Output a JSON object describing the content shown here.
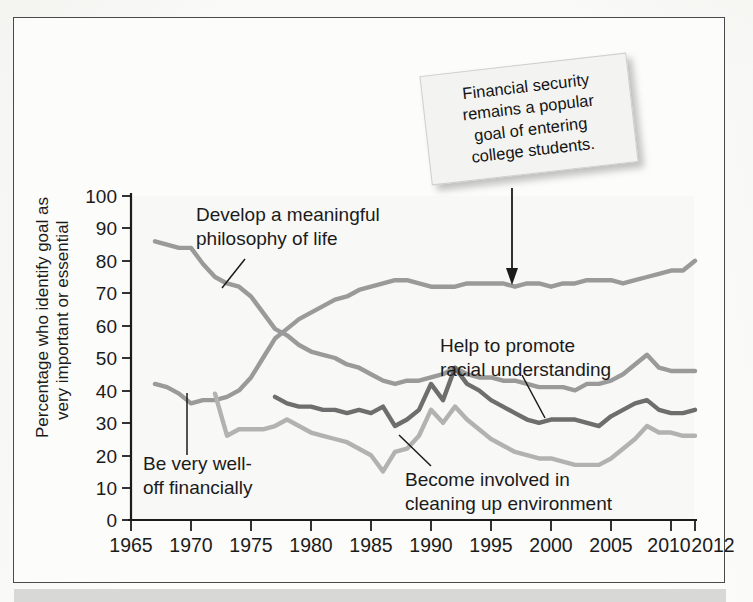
{
  "figure": {
    "callout_note": "Financial security\nremains a popular\ngoal of entering\ncollege students."
  },
  "chart_data": {
    "type": "line",
    "title": "",
    "xlabel": "",
    "ylabel": "Percentage who identify goal as very important or essential",
    "ylabel_line1": "Percentage who identify goal as",
    "ylabel_line2": "very important or essential",
    "xlim": [
      1965,
      2012
    ],
    "ylim": [
      0,
      100
    ],
    "grid": false,
    "legend_position": "inline-annotations",
    "x_tick_labels": [
      "1965",
      "1970",
      "1975",
      "1980",
      "1985",
      "1990",
      "1995",
      "2000",
      "2005",
      "2010",
      "2012"
    ],
    "x_ticks": [
      1965,
      1970,
      1975,
      1980,
      1985,
      1990,
      1995,
      2000,
      2005,
      2010,
      2012
    ],
    "y_tick_labels": [
      "0",
      "10",
      "20",
      "30",
      "40",
      "50",
      "60",
      "70",
      "80",
      "90",
      "100"
    ],
    "y_ticks": [
      0,
      10,
      20,
      30,
      40,
      50,
      60,
      70,
      80,
      90,
      100
    ],
    "series": [
      {
        "name": "Be very well-off financially",
        "color": "#9a9a9a",
        "x": [
          1967,
          1968,
          1969,
          1970,
          1971,
          1972,
          1973,
          1974,
          1975,
          1976,
          1977,
          1978,
          1979,
          1980,
          1981,
          1982,
          1983,
          1984,
          1985,
          1986,
          1987,
          1988,
          1989,
          1990,
          1991,
          1992,
          1993,
          1994,
          1995,
          1996,
          1997,
          1998,
          1999,
          2000,
          2001,
          2002,
          2003,
          2004,
          2005,
          2006,
          2007,
          2008,
          2009,
          2010,
          2011,
          2012
        ],
        "values": [
          42,
          41,
          39,
          36,
          37,
          37,
          38,
          40,
          44,
          50,
          56,
          59,
          62,
          64,
          66,
          68,
          69,
          71,
          72,
          73,
          74,
          74,
          73,
          72,
          72,
          72,
          73,
          73,
          73,
          73,
          72,
          73,
          73,
          72,
          73,
          73,
          74,
          74,
          74,
          73,
          74,
          75,
          76,
          77,
          77,
          80
        ]
      },
      {
        "name": "Develop a meaningful philosophy of life",
        "color": "#9a9a9a",
        "x": [
          1967,
          1968,
          1969,
          1970,
          1971,
          1972,
          1973,
          1974,
          1975,
          1976,
          1977,
          1978,
          1979,
          1980,
          1981,
          1982,
          1983,
          1984,
          1985,
          1986,
          1987,
          1988,
          1989,
          1990,
          1991,
          1992,
          1993,
          1994,
          1995,
          1996,
          1997,
          1998,
          1999,
          2000,
          2001,
          2002,
          2003,
          2004,
          2005,
          2006,
          2007,
          2008,
          2009,
          2010,
          2011,
          2012
        ],
        "values": [
          86,
          85,
          84,
          84,
          79,
          75,
          73,
          72,
          69,
          64,
          59,
          57,
          54,
          52,
          51,
          50,
          48,
          47,
          45,
          43,
          42,
          43,
          43,
          44,
          45,
          47,
          45,
          44,
          44,
          43,
          43,
          42,
          41,
          41,
          41,
          40,
          42,
          42,
          43,
          45,
          48,
          51,
          47,
          46,
          46,
          46
        ]
      },
      {
        "name": "Help to promote racial understanding",
        "color": "#6e6e6e",
        "x": [
          1977,
          1978,
          1979,
          1980,
          1981,
          1982,
          1983,
          1984,
          1985,
          1986,
          1987,
          1988,
          1989,
          1990,
          1991,
          1992,
          1993,
          1994,
          1995,
          1996,
          1997,
          1998,
          1999,
          2000,
          2001,
          2002,
          2003,
          2004,
          2005,
          2006,
          2007,
          2008,
          2009,
          2010,
          2011,
          2012
        ],
        "values": [
          38,
          36,
          35,
          35,
          34,
          34,
          33,
          34,
          33,
          35,
          29,
          31,
          34,
          42,
          37,
          47,
          42,
          40,
          37,
          35,
          33,
          31,
          30,
          31,
          31,
          31,
          30,
          29,
          32,
          34,
          36,
          37,
          34,
          33,
          33,
          34
        ]
      },
      {
        "name": "Become involved in cleaning up environment",
        "color": "#b2b2b2",
        "x": [
          1972,
          1973,
          1974,
          1975,
          1976,
          1977,
          1978,
          1979,
          1980,
          1981,
          1982,
          1983,
          1984,
          1985,
          1986,
          1987,
          1988,
          1989,
          1990,
          1991,
          1992,
          1993,
          1994,
          1995,
          1996,
          1997,
          1998,
          1999,
          2000,
          2001,
          2002,
          2003,
          2004,
          2005,
          2006,
          2007,
          2008,
          2009,
          2010,
          2011,
          2012
        ],
        "values": [
          39,
          26,
          28,
          28,
          28,
          29,
          31,
          29,
          27,
          26,
          25,
          24,
          22,
          20,
          15,
          21,
          22,
          26,
          34,
          30,
          35,
          31,
          28,
          25,
          23,
          21,
          20,
          19,
          19,
          18,
          17,
          17,
          17,
          19,
          22,
          25,
          29,
          27,
          27,
          26,
          26
        ]
      }
    ],
    "annotations": [
      {
        "id": "philosophy-label",
        "text": "Develop a meaningful\nphilosophy of life",
        "line1": "Develop a meaningful",
        "line2": "philosophy of life"
      },
      {
        "id": "financial-label",
        "text": "Be very well-\noff financially",
        "line1": "Be very well-",
        "line2": "off financially"
      },
      {
        "id": "racial-label",
        "text": "Help to promote\nracial understanding",
        "line1": "Help to promote",
        "line2": "racial understanding"
      },
      {
        "id": "environment-label",
        "text": "Become involved in\ncleaning up environment",
        "line1": "Become involved in",
        "line2": "cleaning up environment"
      }
    ]
  }
}
